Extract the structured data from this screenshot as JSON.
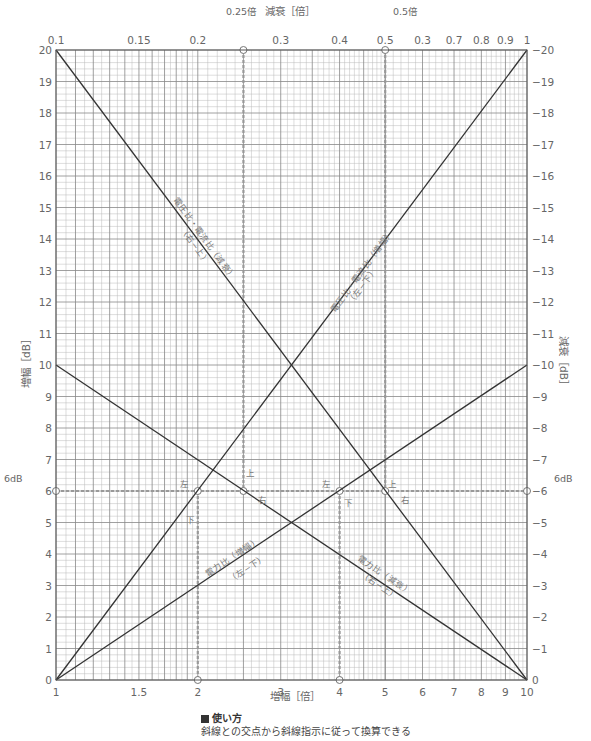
{
  "chart_data": {
    "type": "line",
    "title": "",
    "plot": {
      "left": 56,
      "right": 527,
      "top": 50,
      "bottom": 680
    },
    "x_axis_bottom": {
      "label": "増幅［倍］",
      "scale": "log",
      "range": [
        1,
        10
      ],
      "ticks": [
        1,
        1.5,
        2,
        3,
        4,
        5,
        6,
        7,
        8,
        9,
        10
      ],
      "tick_labels": [
        "1",
        "1.5",
        "2",
        "3",
        "4",
        "5",
        "6",
        "7",
        "8",
        "9",
        "10"
      ]
    },
    "x_axis_top": {
      "label": "減衰［倍］",
      "scale": "log",
      "range": [
        0.1,
        1
      ],
      "ticks": [
        0.1,
        0.15,
        0.2,
        0.3,
        0.4,
        0.5,
        0.6,
        0.7,
        0.8,
        0.9,
        1
      ],
      "tick_labels": [
        "0.1",
        "0.15",
        "0.2",
        "0.3",
        "0.4",
        "0.5",
        "0.3",
        "0.7",
        "0.8",
        "0.9",
        "1"
      ]
    },
    "y_axis_left": {
      "label": "増幅［dB］",
      "range": [
        0,
        20
      ],
      "ticks": [
        0,
        1,
        2,
        3,
        4,
        5,
        6,
        7,
        8,
        9,
        10,
        11,
        12,
        13,
        14,
        15,
        16,
        17,
        18,
        19,
        20
      ]
    },
    "y_axis_right": {
      "label": "減衰［dB］",
      "range": [
        0,
        20
      ],
      "ticks": [
        0,
        1,
        2,
        3,
        4,
        5,
        6,
        7,
        8,
        9,
        10,
        11,
        12,
        13,
        14,
        15,
        16,
        17,
        18,
        19,
        20
      ],
      "tick_prefix": "−"
    },
    "series": [
      {
        "name": "電圧比・電流比（増幅）",
        "direction": "（左−下）",
        "points": [
          [
            1,
            0
          ],
          [
            10,
            20
          ]
        ]
      },
      {
        "name": "電圧比・電流比（減衰）",
        "direction": "（右−上）",
        "points": [
          [
            1,
            20
          ],
          [
            10,
            0
          ]
        ]
      },
      {
        "name": "電力比（増幅）",
        "direction": "（左−下）",
        "points": [
          [
            1,
            0
          ],
          [
            10,
            10
          ]
        ]
      },
      {
        "name": "電力比（減衰）",
        "direction": "（右−上）",
        "points": [
          [
            1,
            10
          ],
          [
            10,
            0
          ]
        ]
      }
    ],
    "annotations": [
      {
        "text": "6dB",
        "at": "left",
        "y": 6
      },
      {
        "text": "6dB",
        "at": "right",
        "y": 6
      },
      {
        "text": "0.25倍",
        "at": "top",
        "x_bottom": 2.5
      },
      {
        "text": "0.5倍",
        "at": "top",
        "x_bottom": 5
      },
      {
        "text": "左",
        "near_x": 2,
        "y": 6
      },
      {
        "text": "下",
        "near_x": 2,
        "y": 6
      },
      {
        "text": "上",
        "near_x": 2.5,
        "y": 6
      },
      {
        "text": "右",
        "near_x": 2.5,
        "y": 6
      },
      {
        "text": "左",
        "near_x": 4,
        "y": 6
      },
      {
        "text": "下",
        "near_x": 4,
        "y": 6
      },
      {
        "text": "上",
        "near_x": 5,
        "y": 6
      },
      {
        "text": "右",
        "near_x": 5,
        "y": 6
      }
    ],
    "guides": {
      "horizontal_dB": 6,
      "vertical_x": [
        2,
        2.5,
        4,
        5
      ]
    },
    "grid": true,
    "legend": null
  },
  "labels": {
    "top_axis_title": "減衰［倍］",
    "bottom_axis_title": "増幅［倍］",
    "left_axis_title": "増幅［dB］",
    "right_axis_title": "減衰［dB］",
    "callout_025": "0.25倍",
    "callout_05": "0.5倍",
    "callout_6db": "6dB",
    "v_amp_name": "電圧比・電流比（増幅）",
    "v_amp_dir": "（左−下）",
    "v_att_name": "電圧比・電流比（減衰）",
    "v_att_dir": "（右−上）",
    "p_amp_name": "電力比（増幅）",
    "p_amp_dir": "（左−下）",
    "p_att_name": "電力比（減衰）",
    "p_att_dir": "（右−上）",
    "left": "左",
    "down": "下",
    "up": "上",
    "right": "右"
  },
  "usage": {
    "title": "使い方",
    "text": "斜線との交点から斜線指示に従って換算できる"
  }
}
